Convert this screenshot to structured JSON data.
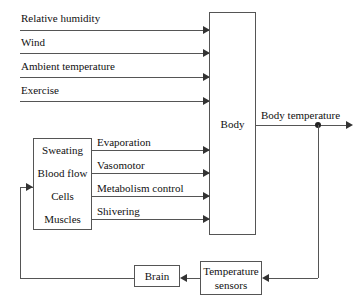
{
  "diagram": {
    "stroke_color": "#555555",
    "arrow_color": "#333333",
    "text_color": "#111111",
    "background": "#ffffff"
  },
  "inputs": [
    {
      "label": "Relative humidity"
    },
    {
      "label": "Wind"
    },
    {
      "label": "Ambient temperature"
    },
    {
      "label": "Exercise"
    }
  ],
  "blocks": {
    "body": {
      "label": "Body"
    },
    "brain": {
      "label": "Brain"
    },
    "sensors": {
      "label_line1": "Temperature",
      "label_line2": "sensors"
    },
    "effectors": {
      "items": [
        {
          "label": "Sweating"
        },
        {
          "label": "Blood flow"
        },
        {
          "label": "Cells"
        },
        {
          "label": "Muscles"
        }
      ]
    }
  },
  "effector_signals": [
    {
      "label": "Evaporation"
    },
    {
      "label": "Vasomotor"
    },
    {
      "label": "Metabolism control"
    },
    {
      "label": "Shivering"
    }
  ],
  "output": {
    "label": "Body temperature"
  }
}
